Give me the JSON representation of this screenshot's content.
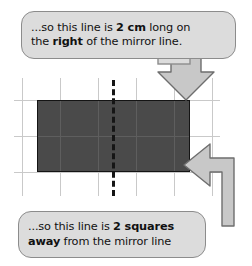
{
  "page": {
    "background": "#ffffff"
  },
  "colors": {
    "bubble_fill": "#dcdcdc",
    "bubble_border": "#8c8c8c",
    "shape_fill": "#4a4a4a",
    "shape_border": "#141414",
    "grid_line": "#c9c9c9",
    "mirror_line": "#151515",
    "arrow_fill": "#c8c8c8",
    "arrow_border": "#6e6e6e",
    "text": "#111111"
  },
  "callouts": [
    {
      "id": "top-callout",
      "name": "callout-right-distance",
      "line1_prefix": "...so this line is ",
      "line1_bold": "2 cm",
      "line1_suffix": " long on",
      "line2_prefix": "the ",
      "line2_bold": "right",
      "line2_suffix": " of the mirror line.",
      "pointer": "down-arrow",
      "pointer_target": "rectangle-top-right-corner"
    },
    {
      "id": "bottom-callout",
      "name": "callout-squares-away",
      "line1_prefix": "...so this line is ",
      "line1_bold": "2 squares",
      "line1_suffix": "",
      "line2_prefix": "",
      "line2_bold": "away",
      "line2_suffix": " from the mirror line",
      "pointer": "left-arrow",
      "pointer_target": "rectangle-right-edge"
    }
  ],
  "diagram": {
    "name": "reflection-grid-diagram",
    "grid": {
      "columns": 5,
      "rows": 3,
      "cell_size_px": 38,
      "vertical_lines_x": [
        22,
        60,
        98,
        136,
        174,
        212
      ],
      "horizontal_lines_y": [
        100,
        136,
        172
      ],
      "v_top": 78,
      "v_bottom": 196,
      "h_left": 14,
      "h_right": 220
    },
    "rectangle": {
      "name": "shaded-rectangle",
      "left": 37,
      "top": 100,
      "width": 153,
      "height": 72,
      "width_squares": 4,
      "height_squares": 2,
      "fill": "#4a4a4a"
    },
    "mirror": {
      "name": "mirror-line",
      "x": 113,
      "top": 80,
      "bottom": 196,
      "style": "dashed",
      "squares_left_of_right_edge": 2
    }
  }
}
